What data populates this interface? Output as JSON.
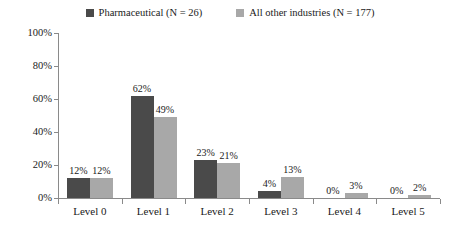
{
  "chart_data": {
    "type": "bar",
    "title": "",
    "subtitle": "",
    "xlabel": "",
    "ylabel": "",
    "ylim": [
      0,
      100
    ],
    "yticks": [
      "0%",
      "20%",
      "40%",
      "60%",
      "80%",
      "100%"
    ],
    "ytick_values": [
      0,
      20,
      40,
      60,
      80,
      100
    ],
    "grid": false,
    "legend_position": "top-center",
    "categories": [
      "Level 0",
      "Level 1",
      "Level 2",
      "Level 3",
      "Level 4",
      "Level 5"
    ],
    "series": [
      {
        "name": "Pharmaceutical (N = 26)",
        "color": "#4a4a4a",
        "values": [
          12,
          62,
          23,
          4,
          0,
          0
        ],
        "labels": [
          "12%",
          "62%",
          "23%",
          "4%",
          "0%",
          "0%"
        ]
      },
      {
        "name": "All other industries (N = 177)",
        "color": "#a8a8a8",
        "values": [
          12,
          49,
          21,
          13,
          3,
          2
        ],
        "labels": [
          "12%",
          "49%",
          "21%",
          "13%",
          "3%",
          "2%"
        ]
      }
    ]
  },
  "legend": {
    "entries": [
      {
        "label": "Pharmaceutical (N = 26)",
        "color": "#4a4a4a"
      },
      {
        "label": "All other industries (N = 177)",
        "color": "#a8a8a8"
      }
    ]
  },
  "colors": {
    "series_dark": "#4a4a4a",
    "series_light": "#a8a8a8",
    "axis": "#8a8a8a",
    "text": "#1a1a1a",
    "background": "#ffffff"
  }
}
